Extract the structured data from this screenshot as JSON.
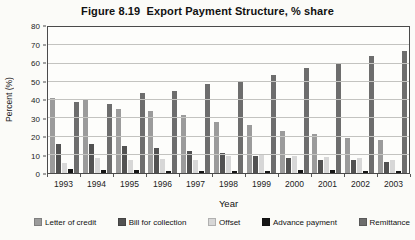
{
  "title": "Figure 8.19  Export Payment Structure, % share",
  "chart_data": {
    "type": "bar",
    "xlabel": "Year",
    "ylabel": "Percent (%)",
    "ylim": [
      0,
      80
    ],
    "ytick_step": 10,
    "grid": true,
    "legend_position": "bottom",
    "categories": [
      "1993",
      "1994",
      "1995",
      "1996",
      "1997",
      "1998",
      "1999",
      "2000",
      "2001",
      "2002",
      "2003"
    ],
    "series": [
      {
        "name": "Letter of credit",
        "color": "#9b9b9b",
        "values": [
          41,
          40,
          35,
          34,
          32,
          28,
          26.5,
          23,
          21.5,
          19,
          18
        ]
      },
      {
        "name": "Bill for collection",
        "color": "#525252",
        "values": [
          16,
          16,
          15,
          13.5,
          12,
          11,
          9.5,
          8,
          7,
          7,
          6
        ]
      },
      {
        "name": "Offset",
        "color": "#d7d7d7",
        "values": [
          5.5,
          8,
          7,
          7.5,
          7,
          9.5,
          10.5,
          9.5,
          9,
          8,
          7
        ]
      },
      {
        "name": "Advance payment",
        "color": "#161616",
        "values": [
          2,
          1.5,
          1.5,
          1,
          1,
          1,
          1,
          1.5,
          1.5,
          1,
          1
        ]
      },
      {
        "name": "Remittance",
        "color": "#6d6d6d",
        "values": [
          39,
          38,
          44,
          45,
          49,
          50,
          53.5,
          57.5,
          60,
          64,
          67
        ]
      }
    ]
  }
}
